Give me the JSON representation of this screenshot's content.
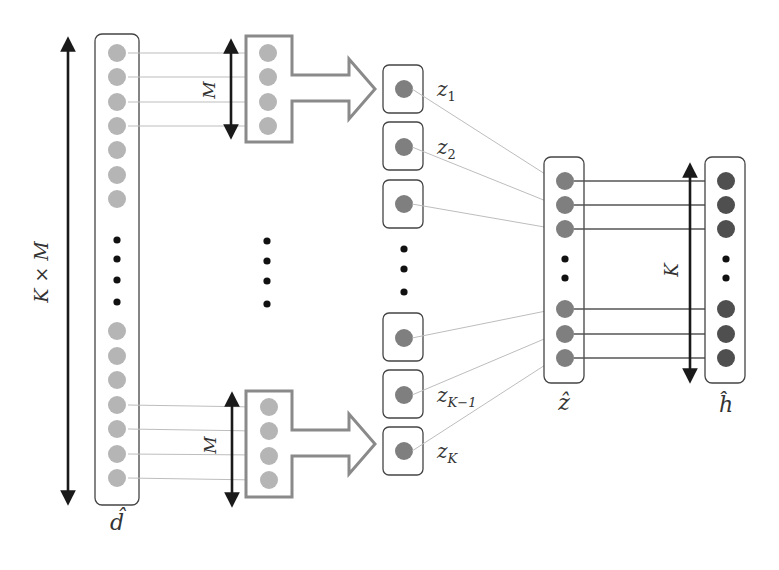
{
  "diagram": {
    "labels": {
      "total_length": "K × M",
      "group_size_top": "M",
      "group_size_bottom": "M",
      "input_vector": "d̂",
      "z_1": "z",
      "z_1_sub": "1",
      "z_2": "z",
      "z_2_sub": "2",
      "z_k_minus_1": "z",
      "z_k_minus_1_sub": "K−1",
      "z_k": "z",
      "z_k_sub": "K",
      "aggregated_vector": "ẑ",
      "output_vector": "ĥ",
      "output_length": "K"
    },
    "colors": {
      "input_node": "#b5b5b5",
      "z_node": "#7f7f7f",
      "output_node": "#4f4f4f",
      "box_stroke": "#444444",
      "group_arrow_stroke": "#8a8a8a",
      "connector_line": "#bdbdbd",
      "dimension_arrow": "#1a1a1a"
    },
    "nodes": {
      "input_column_count_visible": 14,
      "group_size": 4,
      "z_boxes_visible": 5,
      "z_hat_nodes_visible": 6,
      "h_hat_nodes_visible": 6
    }
  }
}
